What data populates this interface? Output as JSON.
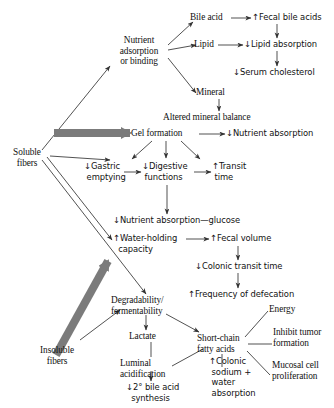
{
  "diagram": {
    "type": "flowchart",
    "colors": {
      "text": "#111111",
      "thin_arrow": "#333333",
      "thick_arrow": "#777777",
      "background": "#ffffff"
    },
    "legend": {
      "up_arrow": "↑",
      "down_arrow": "↓",
      "note": "↑ = increase, ↓ = decrease"
    },
    "nodes": [
      {
        "id": "soluble_fibers",
        "label": "Soluble\nfibers"
      },
      {
        "id": "insoluble_fibers",
        "label": "Insoluble\nfibers"
      },
      {
        "id": "nutrient_adsorption",
        "label": "Nutrient\nadsorption\nor binding"
      },
      {
        "id": "bile_acid",
        "label": "Bile acid"
      },
      {
        "id": "fecal_bile_acids",
        "label": "↑Fecal bile acids"
      },
      {
        "id": "lipid",
        "label": "Lipid"
      },
      {
        "id": "lipid_absorption",
        "label": "↓Lipid absorption"
      },
      {
        "id": "serum_cholesterol",
        "label": "↓Serum cholesterol"
      },
      {
        "id": "mineral",
        "label": "Mineral"
      },
      {
        "id": "altered_mineral",
        "label": "Altered mineral balance"
      },
      {
        "id": "gel_formation",
        "label": "Gel formation"
      },
      {
        "id": "nutrient_absorption",
        "label": "↓Nutrient absorption"
      },
      {
        "id": "gastric_emptying",
        "label": "↓Gastric\n emptying"
      },
      {
        "id": "digestive_functions",
        "label": "↓Digestive\n functions"
      },
      {
        "id": "transit_time",
        "label": "↑Transit\n time"
      },
      {
        "id": "nutrient_abs_glucose",
        "label": "↓Nutrient absorption—glucose"
      },
      {
        "id": "water_holding",
        "label": "↑Water-holding\n  capacity"
      },
      {
        "id": "fecal_volume",
        "label": "↑Fecal volume"
      },
      {
        "id": "colonic_transit_time",
        "label": "↓Colonic transit time"
      },
      {
        "id": "frequency_defecation",
        "label": "↑Frequency of defecation"
      },
      {
        "id": "degradability",
        "label": "Degradability/\nfermentability"
      },
      {
        "id": "lactate",
        "label": "Lactate"
      },
      {
        "id": "luminal_acidification",
        "label": "Luminal\nacidification"
      },
      {
        "id": "bile_acid_synthesis",
        "label": "↓2° bile acid\n  synthesis"
      },
      {
        "id": "short_chain_fatty",
        "label": "Short-chain\nfatty acids"
      },
      {
        "id": "energy",
        "label": "Energy"
      },
      {
        "id": "inhibit_tumor",
        "label": "Inhibit tumor\nformation"
      },
      {
        "id": "mucosal_cell",
        "label": "Mucosal cell\nproliferation"
      },
      {
        "id": "colonic_sodium",
        "label": "↑Colonic\n sodium +\n water\n absorption"
      }
    ],
    "edges": [
      {
        "from": "soluble_fibers",
        "to": "nutrient_adsorption",
        "style": "thin"
      },
      {
        "from": "soluble_fibers",
        "to": "gel_formation",
        "style": "thick"
      },
      {
        "from": "soluble_fibers",
        "to": "gastric_emptying",
        "style": "thin"
      },
      {
        "from": "soluble_fibers",
        "to": "water_holding",
        "style": "thin"
      },
      {
        "from": "soluble_fibers",
        "to": "degradability",
        "style": "thin"
      },
      {
        "from": "nutrient_adsorption",
        "to": "bile_acid",
        "style": "thin"
      },
      {
        "from": "nutrient_adsorption",
        "to": "lipid",
        "style": "thin"
      },
      {
        "from": "nutrient_adsorption",
        "to": "mineral",
        "style": "thin"
      },
      {
        "from": "bile_acid",
        "to": "fecal_bile_acids",
        "style": "thin"
      },
      {
        "from": "fecal_bile_acids",
        "to": "lipid_absorption",
        "style": "thin"
      },
      {
        "from": "lipid",
        "to": "lipid_absorption",
        "style": "thin"
      },
      {
        "from": "lipid_absorption",
        "to": "serum_cholesterol",
        "style": "thin"
      },
      {
        "from": "mineral",
        "to": "altered_mineral",
        "style": "thin"
      },
      {
        "from": "gel_formation",
        "to": "nutrient_absorption",
        "style": "thin"
      },
      {
        "from": "gel_formation",
        "to": "gastric_emptying",
        "style": "thin"
      },
      {
        "from": "gel_formation",
        "to": "digestive_functions",
        "style": "thin"
      },
      {
        "from": "gel_formation",
        "to": "transit_time",
        "style": "thin"
      },
      {
        "from": "gastric_emptying",
        "to": "digestive_functions",
        "style": "thin"
      },
      {
        "from": "digestive_functions",
        "to": "transit_time",
        "style": "thin"
      },
      {
        "from": "digestive_functions",
        "to": "nutrient_abs_glucose",
        "style": "thin"
      },
      {
        "from": "water_holding",
        "to": "fecal_volume",
        "style": "thin"
      },
      {
        "from": "fecal_volume",
        "to": "colonic_transit_time",
        "style": "thin"
      },
      {
        "from": "colonic_transit_time",
        "to": "frequency_defecation",
        "style": "thin"
      },
      {
        "from": "insoluble_fibers",
        "to": "water_holding",
        "style": "thick"
      },
      {
        "from": "insoluble_fibers",
        "to": "degradability",
        "style": "thin"
      },
      {
        "from": "degradability",
        "to": "lactate",
        "style": "thin"
      },
      {
        "from": "degradability",
        "to": "short_chain_fatty",
        "style": "thin"
      },
      {
        "from": "lactate",
        "to": "luminal_acidification",
        "style": "line"
      },
      {
        "from": "luminal_acidification",
        "to": "bile_acid_synthesis",
        "style": "thin"
      },
      {
        "from": "short_chain_fatty",
        "to": "luminal_acidification",
        "style": "line"
      },
      {
        "from": "short_chain_fatty",
        "to": "energy",
        "style": "line"
      },
      {
        "from": "short_chain_fatty",
        "to": "inhibit_tumor",
        "style": "line"
      },
      {
        "from": "short_chain_fatty",
        "to": "mucosal_cell",
        "style": "line"
      },
      {
        "from": "short_chain_fatty",
        "to": "colonic_sodium",
        "style": "line"
      }
    ]
  }
}
